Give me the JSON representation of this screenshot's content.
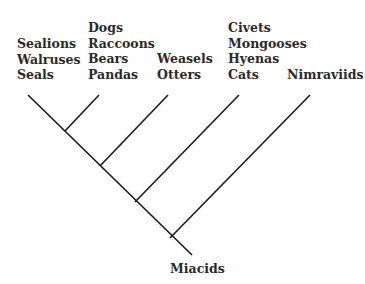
{
  "diagram": {
    "type": "cladogram",
    "line_color": "#1a1a1a",
    "root": "Miacids",
    "clades": [
      {
        "id": "pinnipeds",
        "taxa": [
          "Sealions",
          "Walruses",
          "Seals"
        ]
      },
      {
        "id": "canids-ursids",
        "taxa": [
          "Dogs",
          "Raccoons",
          "Bears",
          "Pandas"
        ]
      },
      {
        "id": "mustelids",
        "taxa": [
          "Weasels",
          "Otters"
        ]
      },
      {
        "id": "feliforms",
        "taxa": [
          "Civets",
          "Mongooses",
          "Hyenas",
          "Cats"
        ]
      },
      {
        "id": "nimraviids",
        "taxa": [
          "Nimraviids"
        ]
      }
    ]
  }
}
